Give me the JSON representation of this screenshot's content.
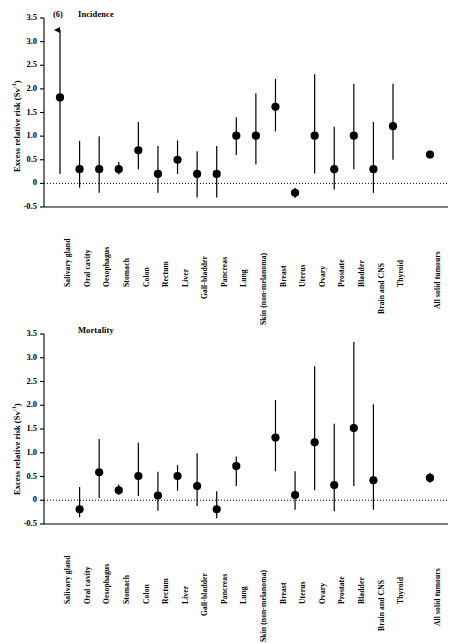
{
  "figure": {
    "ylabel": "Excess relative risk (Sv",
    "ylabel_sup": "-1",
    "ylabel_close": ")",
    "overflow_note": "(6)"
  },
  "chart_data": [
    {
      "type": "scatter",
      "title": "Incidence",
      "xlabel": "",
      "ylabel": "Excess relative risk (Sv-1)",
      "ylim": [
        -0.5,
        3.5
      ],
      "yticks": [
        "-0.5",
        "0",
        "0.5",
        "1.0",
        "1.5",
        "2.0",
        "2.5",
        "3.0",
        "3.5"
      ],
      "ytick_values": [
        -0.5,
        0,
        0.5,
        1.0,
        1.5,
        2.0,
        2.5,
        3.0,
        3.5
      ],
      "grid": false,
      "legend": "none",
      "zero_reference_line": 0,
      "categories": [
        "Salivary gland",
        "Oral cavity",
        "Oesophagus",
        "Stomach",
        "Colon",
        "Rectum",
        "Liver",
        "Gall-bladder",
        "Pancreas",
        "Lung",
        "Skin (non-melanoma)",
        "Breast",
        "Uterus",
        "Ovary",
        "Prostate",
        "Bladder",
        "Brain and CNS",
        "Thyroid",
        "All solid tumours"
      ],
      "values": [
        1.82,
        0.3,
        0.3,
        0.3,
        0.7,
        0.2,
        0.5,
        0.2,
        0.2,
        1.01,
        1.01,
        1.62,
        -0.2,
        1.01,
        0.3,
        1.01,
        0.3,
        1.21,
        0.61
      ],
      "ci_lower": [
        0.2,
        -0.09,
        -0.2,
        0.19,
        0.3,
        -0.2,
        0.2,
        -0.3,
        -0.3,
        0.6,
        0.4,
        1.1,
        -0.31,
        0.21,
        -0.13,
        0.3,
        -0.2,
        0.5,
        0.54
      ],
      "ci_upper": [
        3.3,
        0.9,
        1.0,
        0.45,
        1.3,
        0.79,
        0.91,
        0.68,
        0.79,
        1.4,
        1.91,
        2.21,
        -0.09,
        2.31,
        1.2,
        2.11,
        1.3,
        2.11,
        0.69
      ],
      "ci_upper_clipped": [
        true,
        false,
        false,
        false,
        false,
        false,
        false,
        false,
        false,
        false,
        false,
        false,
        false,
        false,
        false,
        false,
        false,
        false,
        false
      ],
      "annotations": [
        {
          "text": "(6)",
          "category": "Salivary gland",
          "note": "upper confidence limit extends off scale to 6"
        }
      ]
    },
    {
      "type": "scatter",
      "title": "Mortality",
      "xlabel": "",
      "ylabel": "Excess relative risk (Sv-1)",
      "ylim": [
        -0.5,
        3.5
      ],
      "yticks": [
        "-0.5",
        "0",
        "0.5",
        "1.0",
        "1.5",
        "2.0",
        "2.5",
        "3.0",
        "3.5"
      ],
      "ytick_values": [
        -0.5,
        0,
        0.5,
        1.0,
        1.5,
        2.0,
        2.5,
        3.0,
        3.5
      ],
      "grid": false,
      "legend": "none",
      "zero_reference_line": 0,
      "categories": [
        "Salivary gland",
        "Oral cavity",
        "Oesophagus",
        "Stomach",
        "Colon",
        "Rectum",
        "Liver",
        "Gall-bladder",
        "Pancreas",
        "Lung",
        "Skin (non-melanoma)",
        "Breast",
        "Uterus",
        "Ovary",
        "Prostate",
        "Bladder",
        "Brain and CNS",
        "Thyroid",
        "All solid tumours"
      ],
      "values": [
        null,
        -0.19,
        0.59,
        0.21,
        0.51,
        0.1,
        0.51,
        0.3,
        -0.19,
        0.72,
        null,
        1.32,
        0.11,
        1.22,
        0.32,
        1.52,
        0.42,
        null,
        0.47
      ],
      "ci_lower": [
        null,
        -0.36,
        0.05,
        0.11,
        0.09,
        -0.22,
        0.2,
        -0.12,
        -0.38,
        0.3,
        null,
        0.61,
        -0.2,
        0.21,
        -0.23,
        0.3,
        -0.2,
        null,
        0.37
      ],
      "ci_upper": [
        null,
        0.28,
        1.29,
        0.33,
        1.21,
        0.6,
        0.74,
        0.99,
        0.19,
        0.92,
        null,
        2.11,
        0.61,
        2.82,
        1.61,
        3.33,
        2.02,
        null,
        0.58
      ],
      "ci_upper_clipped": [
        false,
        false,
        false,
        false,
        false,
        false,
        false,
        false,
        false,
        false,
        false,
        false,
        false,
        false,
        false,
        false,
        false,
        false,
        false
      ],
      "annotations": []
    }
  ]
}
